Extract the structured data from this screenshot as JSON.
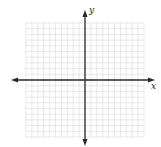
{
  "diagram": {
    "type": "cartesian-coordinate-grid",
    "axes": {
      "x_label": "x",
      "y_label": "y",
      "arrows": "both-ends"
    },
    "grid": {
      "cells_x": 20,
      "cells_y": 20,
      "cells_left_of_y_axis": 10,
      "cells_above_x_axis": 10,
      "tick_labels": "none"
    },
    "colors": {
      "grid_line": "#d8d8d8",
      "axis_line": "#2a2a2a",
      "background": "#ffffff"
    }
  }
}
